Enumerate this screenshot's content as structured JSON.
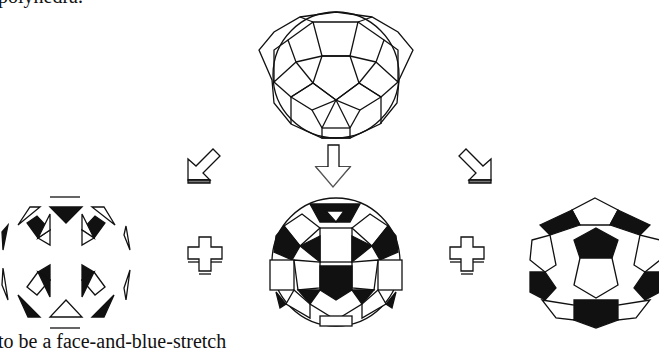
{
  "figure": {
    "top_caption_fragment": "polyhedra.",
    "bottom_caption_fragment": "to be a face-and-blue-stretch",
    "panels": [
      {
        "id": "source",
        "label": "rhombicosidodecahedron-outline"
      },
      {
        "id": "left",
        "label": "triangle-faces-subset"
      },
      {
        "id": "center",
        "label": "rhombicosidodecahedron-shaded"
      },
      {
        "id": "right",
        "label": "pentagon-faces-truncated-icosahedron"
      }
    ],
    "operators": [
      "+",
      "+"
    ],
    "arrows": [
      "down-left",
      "down",
      "down-right"
    ],
    "colors": {
      "ink": "#111111",
      "paper": "#ffffff"
    }
  }
}
